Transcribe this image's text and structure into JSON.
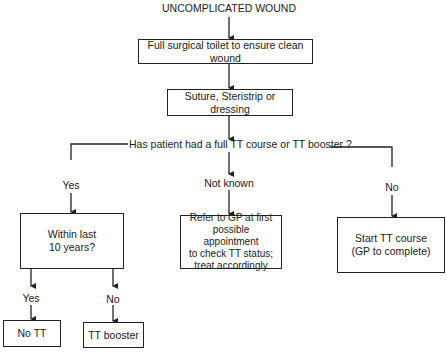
{
  "title": "UNCOMPLICATED WOUND",
  "nodes": {
    "toilet": "Full surgical toilet to ensure clean wound",
    "closure": "Suture, Steristrip or dressing",
    "question": "Has patient had a full TT course or TT booster ?",
    "within10": "Within last\n10 years?",
    "refer": "Refer to GP at first\npossible appointment\nto check TT status;\ntreat accordingly",
    "start": "Start TT course\n(GP to complete)",
    "no_tt": "No TT",
    "booster": "TT booster"
  },
  "edges": {
    "yes": "Yes",
    "not_known": "Not known",
    "no": "No",
    "sub_yes": "Yes",
    "sub_no": "No"
  },
  "colors": {
    "line": "#222222",
    "text": "#1a1a1a",
    "background": "#ffffff"
  }
}
